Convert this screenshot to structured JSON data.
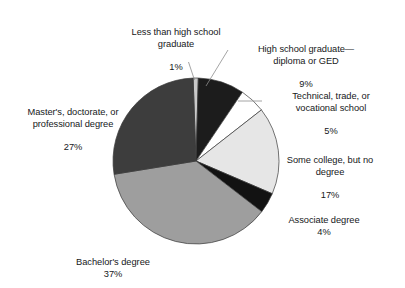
{
  "chart_data": {
    "type": "pie",
    "title": "",
    "subtitle": "",
    "xlabel": "",
    "ylabel": "",
    "legend_position": "none",
    "grid": false,
    "labels_show_percent": true,
    "start_angle_deg": -92,
    "direction": "clockwise",
    "categories": [
      "Less than high school graduate",
      "High school graduate—diploma or GED",
      "Technical, trade, or vocational school",
      "Some college, but no degree",
      "Associate degree",
      "Bachelor's degree",
      "Master's, doctorate, or professional degree"
    ],
    "values": [
      1,
      9,
      5,
      17,
      4,
      37,
      27
    ],
    "value_unit": "%",
    "colors": [
      "#c9c9c9",
      "#1c1c1c",
      "#ffffff",
      "#e6e6e6",
      "#121212",
      "#9e9e9e",
      "#3d3d3d"
    ],
    "slice_outline_color": "#3a3a3a",
    "leader_line_color": "#8d8d8d",
    "slices": [
      {
        "name": "Less than high school graduate",
        "label_line1": "Less than high school",
        "label_line2": "graduate",
        "percent_text": "1%",
        "value": 1,
        "color": "#c9c9c9",
        "has_leader_line": true
      },
      {
        "name": "High school graduate—diploma or GED",
        "label_line1": "High school graduate—",
        "label_line2": "diploma or GED",
        "percent_text": "9%",
        "value": 9,
        "color": "#1c1c1c",
        "has_leader_line": true
      },
      {
        "name": "Technical, trade, or vocational school",
        "label_line1": "Technical, trade, or",
        "label_line2": "vocational school",
        "percent_text": "5%",
        "value": 5,
        "color": "#ffffff",
        "has_leader_line": true
      },
      {
        "name": "Some college, but no degree",
        "label_line1": "Some college, but no",
        "label_line2": "degree",
        "percent_text": "17%",
        "value": 17,
        "color": "#e6e6e6",
        "has_leader_line": false
      },
      {
        "name": "Associate degree",
        "label_line1": "Associate degree",
        "label_line2": "",
        "percent_text": "4%",
        "value": 4,
        "color": "#121212",
        "has_leader_line": false
      },
      {
        "name": "Bachelor's degree",
        "label_line1": "Bachelor's degree",
        "label_line2": "",
        "percent_text": "37%",
        "value": 37,
        "color": "#9e9e9e",
        "has_leader_line": false
      },
      {
        "name": "Master's, doctorate, or professional degree",
        "label_line1": "Master's, doctorate, or",
        "label_line2": "professional degree",
        "percent_text": "27%",
        "value": 27,
        "color": "#3d3d3d",
        "has_leader_line": false
      }
    ]
  },
  "geometry": {
    "center_x": 196,
    "center_y": 161,
    "radius": 83
  }
}
